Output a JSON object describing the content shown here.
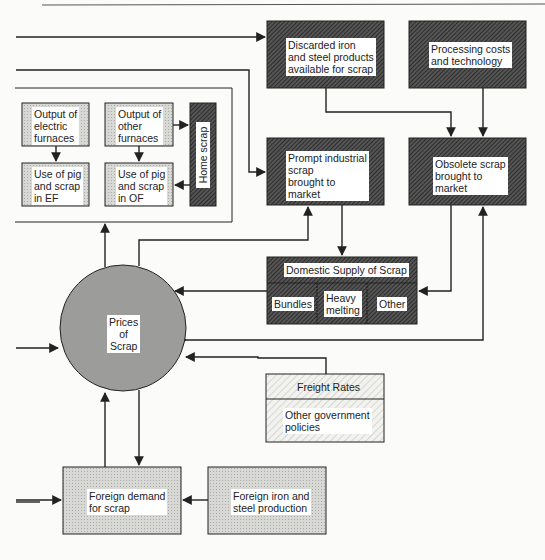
{
  "diagram": {
    "nodes": {
      "discarded": {
        "label": "Discarded iron\nand steel products\navailable for scrap",
        "lines": [
          "Discarded iron",
          "and steel products",
          "available for scrap"
        ]
      },
      "processing": {
        "lines": [
          "Processing costs",
          "and technology"
        ]
      },
      "output_ef": {
        "lines": [
          "Output of",
          "electric",
          "furnaces"
        ]
      },
      "output_of": {
        "lines": [
          "Output of",
          "other",
          "furnaces"
        ]
      },
      "use_ef": {
        "lines": [
          "Use of pig",
          "and scrap",
          "in EF"
        ]
      },
      "use_of": {
        "lines": [
          "Use of pig",
          "and scrap",
          "in OF"
        ]
      },
      "home_scrap": {
        "label": "Home scrap"
      },
      "prompt": {
        "lines": [
          "Prompt industrial",
          "scrap",
          "brought to",
          "market"
        ]
      },
      "obsolete": {
        "lines": [
          "Obsolete scrap",
          "brought to",
          "market"
        ]
      },
      "domestic_supply": {
        "label": "Domestic Supply of Scrap",
        "parts": [
          {
            "lines": [
              "Bundles"
            ]
          },
          {
            "lines": [
              "Heavy",
              "melting"
            ]
          },
          {
            "lines": [
              "Other"
            ]
          }
        ]
      },
      "prices": {
        "lines": [
          "Prices",
          "of",
          "Scrap"
        ]
      },
      "freight": {
        "label": "Freight Rates"
      },
      "gov": {
        "lines": [
          "Other government",
          "policies"
        ]
      },
      "foreign_demand": {
        "lines": [
          "Foreign demand",
          "for scrap"
        ]
      },
      "foreign_production": {
        "lines": [
          "Foreign iron and",
          "steel production"
        ]
      }
    },
    "colors": {
      "dark_hatch": "#3a3a3a",
      "light_fill": "#d4d4d0",
      "circle_fill": "#9a9a98",
      "line": "#222222",
      "background": "#fbfbf9"
    }
  }
}
